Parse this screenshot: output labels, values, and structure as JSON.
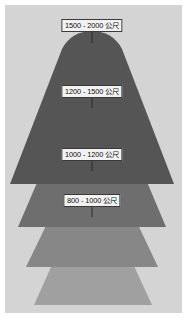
{
  "figure": {
    "type": "elevation-zone-diagram",
    "unit_label": "公尺",
    "background_color": "#d4d4d4",
    "border_color": "#ffffff",
    "width": 187,
    "height": 318
  },
  "zones": [
    {
      "id": "zone-1500-2000",
      "label": "1500 - 2000 公尺",
      "range_min": 1500,
      "range_max": 2000,
      "color": "#555555",
      "label_x": 92,
      "label_y": 19,
      "leader_x": 92,
      "leader_y": 31,
      "leader_height": 12
    },
    {
      "id": "zone-1200-1500",
      "label": "1200 - 1500 公尺",
      "range_min": 1200,
      "range_max": 1500,
      "color": "#6e6e6e",
      "label_x": 92,
      "label_y": 85,
      "leader_x": 92,
      "leader_y": 97,
      "leader_height": 11
    },
    {
      "id": "zone-1000-1200",
      "label": "1000 - 1200 公尺",
      "range_min": 1000,
      "range_max": 1200,
      "color": "#878787",
      "label_x": 92,
      "label_y": 148,
      "leader_x": 92,
      "leader_y": 160,
      "leader_height": 11
    },
    {
      "id": "zone-800-1000",
      "label": "800 - 1000 公尺",
      "range_min": 800,
      "range_max": 1000,
      "color": "#a0a0a0",
      "label_x": 92,
      "label_y": 194,
      "leader_x": 92,
      "leader_y": 206,
      "leader_height": 11
    }
  ]
}
